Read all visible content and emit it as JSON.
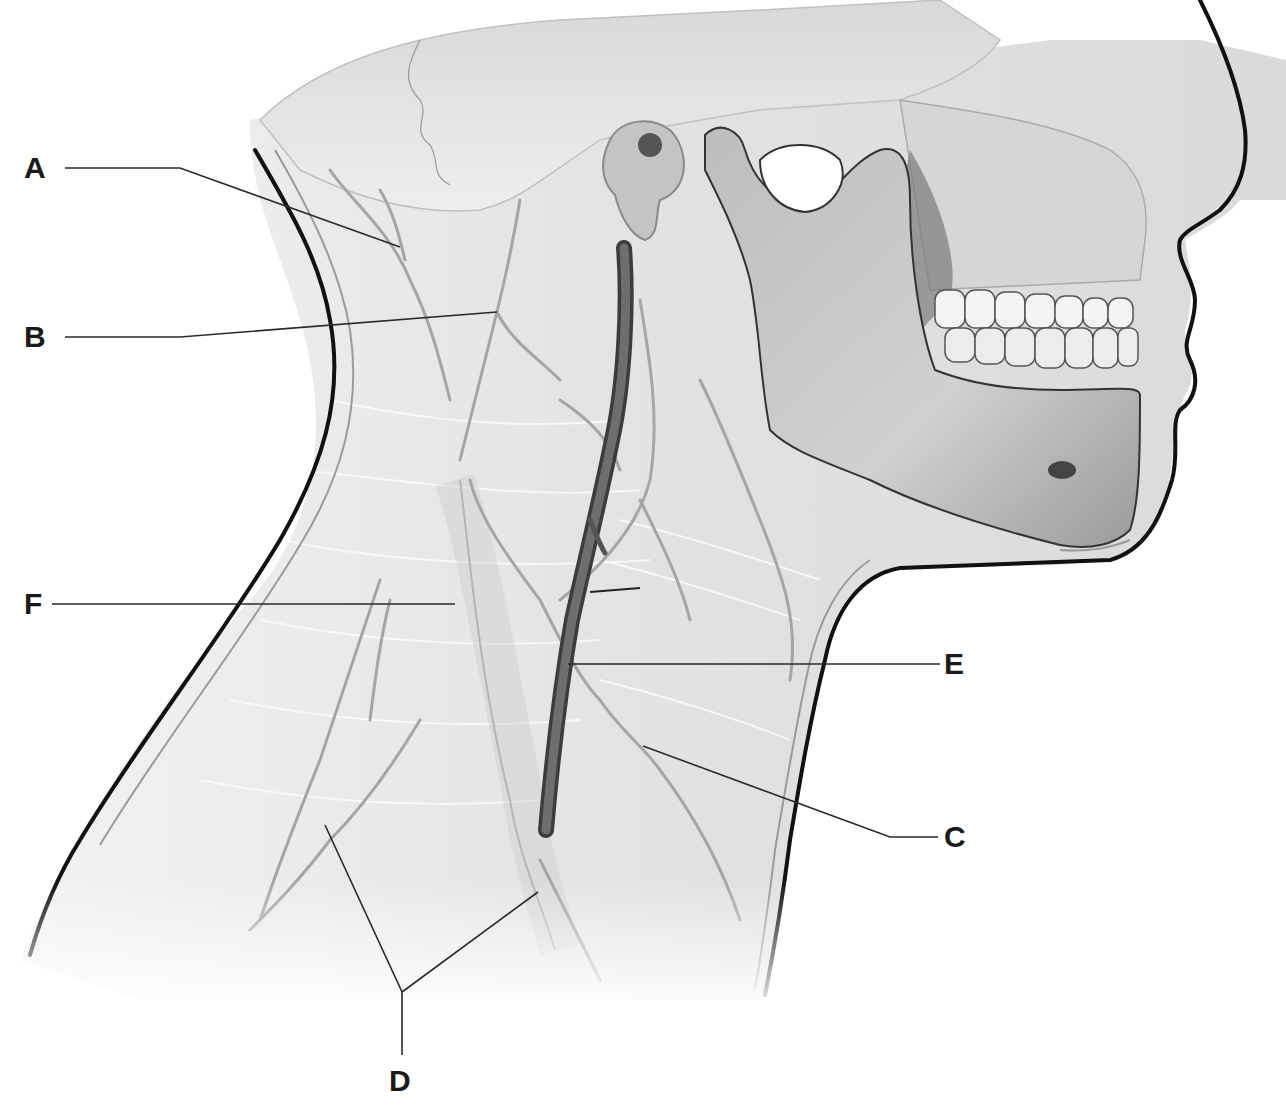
{
  "diagram": {
    "labels": [
      {
        "id": "A",
        "text": "A",
        "x": 26,
        "y": 156,
        "pointer": [
          [
            65,
            168
          ],
          [
            180,
            168
          ],
          [
            400,
            247
          ]
        ]
      },
      {
        "id": "B",
        "text": "B",
        "x": 26,
        "y": 325,
        "pointer": [
          [
            65,
            337
          ],
          [
            180,
            337
          ],
          [
            497,
            312
          ]
        ]
      },
      {
        "id": "F",
        "text": "F",
        "x": 26,
        "y": 592,
        "pointer": [
          [
            52,
            604
          ],
          [
            455,
            604
          ]
        ]
      },
      {
        "id": "E",
        "text": "E",
        "x": 945,
        "y": 651,
        "pointer": [
          [
            940,
            664
          ],
          [
            568,
            664
          ]
        ]
      },
      {
        "id": "C",
        "text": "C",
        "x": 945,
        "y": 824,
        "pointer": [
          [
            938,
            837
          ],
          [
            890,
            837
          ],
          [
            643,
            746
          ]
        ]
      },
      {
        "id": "D",
        "text": "D",
        "x": 389,
        "y": 1068,
        "pointer": [
          [
            402,
            1055
          ],
          [
            402,
            992
          ],
          [
            325,
            825
          ],
          [
            402,
            992
          ],
          [
            538,
            892
          ]
        ]
      }
    ],
    "colors": {
      "label_text": "#1a1a1a",
      "leader_line": "#2a2a2a",
      "outline": "#111111",
      "tissue": "#e6e6e6",
      "bone": "#cfcfcf",
      "bone_shadow": "#8a8a8a",
      "vessel": "#6b6b6b",
      "teeth": "#f4f4f4"
    }
  }
}
